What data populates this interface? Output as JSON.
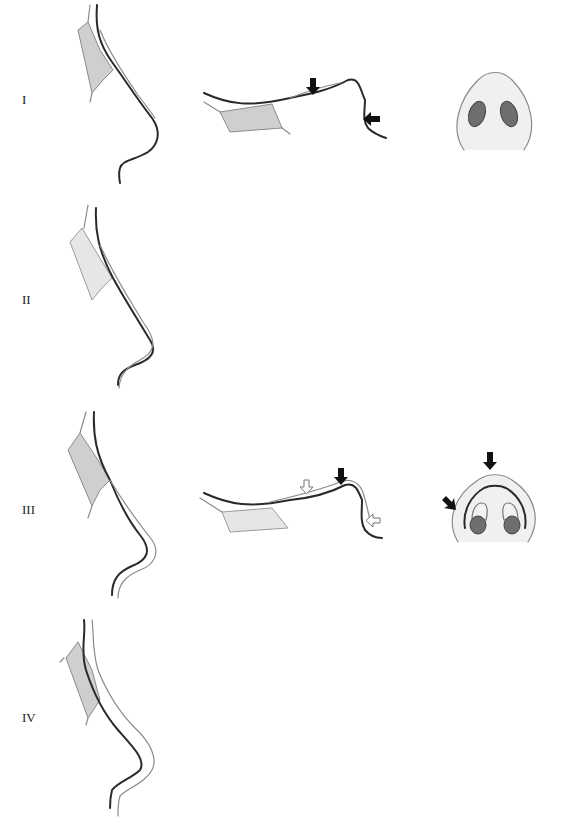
{
  "figure": {
    "type": "medical illustration",
    "columns": [
      "profile-view",
      "lateral-dorsum-view",
      "basal-view"
    ],
    "colors": {
      "outline_dark": "#2a2a2a",
      "outline_light": "#8a8a8a",
      "bone_fill": "#cfcfcf",
      "nostril_fill": "#6e6e6e",
      "arrow_black": "#111111",
      "arrow_white": "#ffffff"
    }
  },
  "rows": [
    {
      "label": "I",
      "lateral_arrows": {
        "black": 2,
        "white": 0
      },
      "basal_arrows": {
        "black": 0
      }
    },
    {
      "label": "II",
      "lateral_arrows": {
        "black": 1,
        "white": 2
      },
      "basal_arrows": {
        "black": 2
      }
    },
    {
      "label": "III",
      "lateral_arrows": {
        "black": 2,
        "white": 3
      },
      "basal_arrows": {
        "black": 2
      }
    },
    {
      "label": "IV",
      "lateral_arrows": {
        "black": 2,
        "white": 3
      },
      "basal_arrows": {
        "black": 2
      }
    }
  ]
}
